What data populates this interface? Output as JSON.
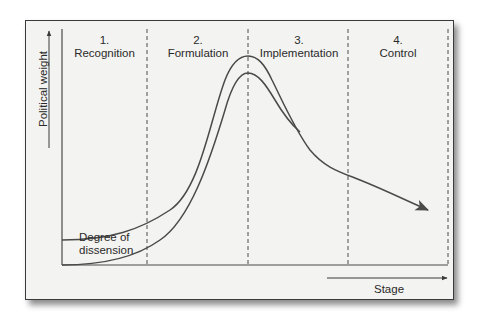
{
  "diagram": {
    "type": "policy-process-curve",
    "y_axis_label": "Political weight",
    "x_axis_label": "Stage",
    "stages": [
      {
        "number": "1.",
        "name": "Recognition"
      },
      {
        "number": "2.",
        "name": "Formulation"
      },
      {
        "number": "3.",
        "name": "Implementation"
      },
      {
        "number": "4.",
        "name": "Control"
      }
    ],
    "curves": [
      {
        "name": "political-weight",
        "description": "Outer curve rising through formulation, peaking at start of implementation, then declining with arrow into control"
      },
      {
        "name": "degree-of-dissension",
        "description": "Inner curve starting at baseline, peaking at start of implementation, merging with outer curve"
      }
    ],
    "band_label": "Degree of dissension"
  },
  "colors": {
    "frame_bg": "#f3f3f1",
    "line": "#4a4a4a",
    "text": "#2a2a2a"
  }
}
